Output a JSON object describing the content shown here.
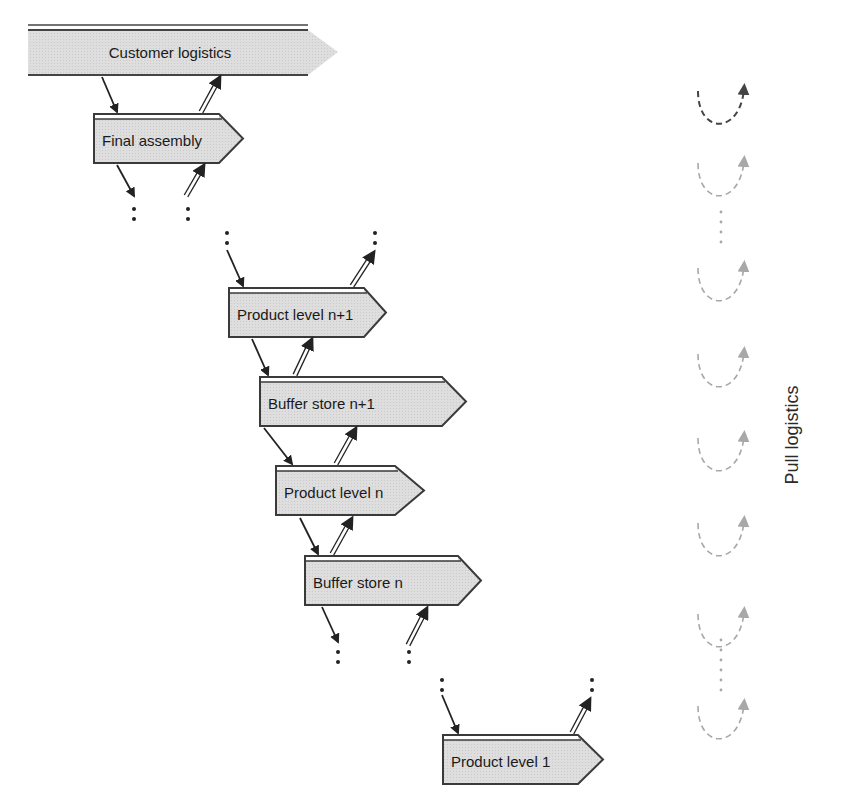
{
  "diagram": {
    "title_band": {
      "label": "Customer logistics"
    },
    "nodes": [
      {
        "id": "final-assembly",
        "label": "Final assembly"
      },
      {
        "id": "product-level-n-plus-1",
        "label": "Product level n+1"
      },
      {
        "id": "buffer-store-n-plus-1",
        "label": "Buffer store n+1"
      },
      {
        "id": "product-level-n",
        "label": "Product level n"
      },
      {
        "id": "buffer-store-n",
        "label": "Buffer store n"
      },
      {
        "id": "product-level-1",
        "label": "Product level 1"
      }
    ],
    "side_label": "Pull logistics",
    "colors": {
      "box_fill": "#dcdcdc",
      "box_stroke": "#3a3a3a",
      "arrow": "#222222",
      "pull_dark": "#444444",
      "pull_light": "#a8a8a8"
    }
  }
}
